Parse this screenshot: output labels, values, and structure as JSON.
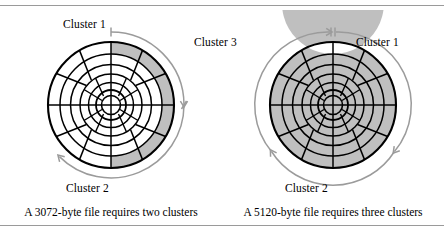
{
  "figure": {
    "type": "disk-cluster-allocation-diagram",
    "rules": {
      "top_visible": true,
      "bottom_visible": true
    }
  },
  "colors": {
    "shaded_sector": "#bfbfbf",
    "track_line": "#000000",
    "arc_indicator": "#9b9b9b",
    "rule": "#9a9a9a",
    "background": "#ffffff"
  },
  "diagrams": [
    {
      "id": "left",
      "caption": "A 3072-byte file requires two clusters",
      "labels": {
        "top": "Cluster 1",
        "bottom": "Cluster 2"
      },
      "disk": {
        "tracks": 6,
        "sectors": 12,
        "shaded_track_index": 6,
        "shaded_from_deg": 0,
        "shaded_to_deg": 180
      },
      "indicators": [
        {
          "name": "cluster-1-arc",
          "from_deg": 0,
          "to_deg": 90,
          "label": "Cluster 1"
        },
        {
          "name": "cluster-2-arc",
          "from_deg": 90,
          "to_deg": 225,
          "label": "Cluster 2"
        }
      ]
    },
    {
      "id": "right",
      "caption": "A 5120-byte file requires three clusters",
      "labels": {
        "top_left": "Cluster 3",
        "top_right": "Cluster 1",
        "bottom": "Cluster 2"
      },
      "disk": {
        "tracks": 6,
        "sectors": 12,
        "shaded_track_index": 6,
        "shaded_from_deg": 0,
        "shaded_to_deg": 360
      },
      "indicators": [
        {
          "name": "cluster-1-arc",
          "from_deg": 0,
          "to_deg": 115,
          "label": "Cluster 1"
        },
        {
          "name": "cluster-2-arc",
          "from_deg": 115,
          "to_deg": 245,
          "label": "Cluster 2"
        },
        {
          "name": "cluster-3-arc",
          "from_deg": 245,
          "to_deg": 360,
          "label": "Cluster 3"
        }
      ]
    }
  ]
}
